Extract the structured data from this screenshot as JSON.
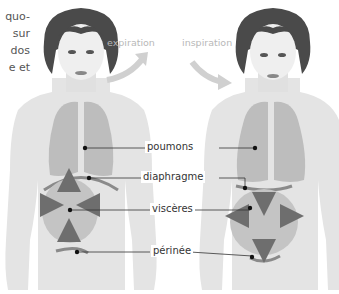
{
  "intro_text_fragments": [
    "quo-",
    "sur",
    "dos",
    "e et"
  ],
  "phases": {
    "left": "expiration",
    "right": "inspiration"
  },
  "labels": {
    "lungs": "poumons",
    "diaphragm": "diaphragme",
    "viscera": "viscères",
    "perineum": "périnée"
  },
  "colors": {
    "body": "#e4e4e4",
    "organs": "#bdbdbd",
    "arrows": "#6e6e6e",
    "phase_arrow": "#d0d0d0",
    "hair": "#4a4a4a",
    "leader": "#333333"
  }
}
